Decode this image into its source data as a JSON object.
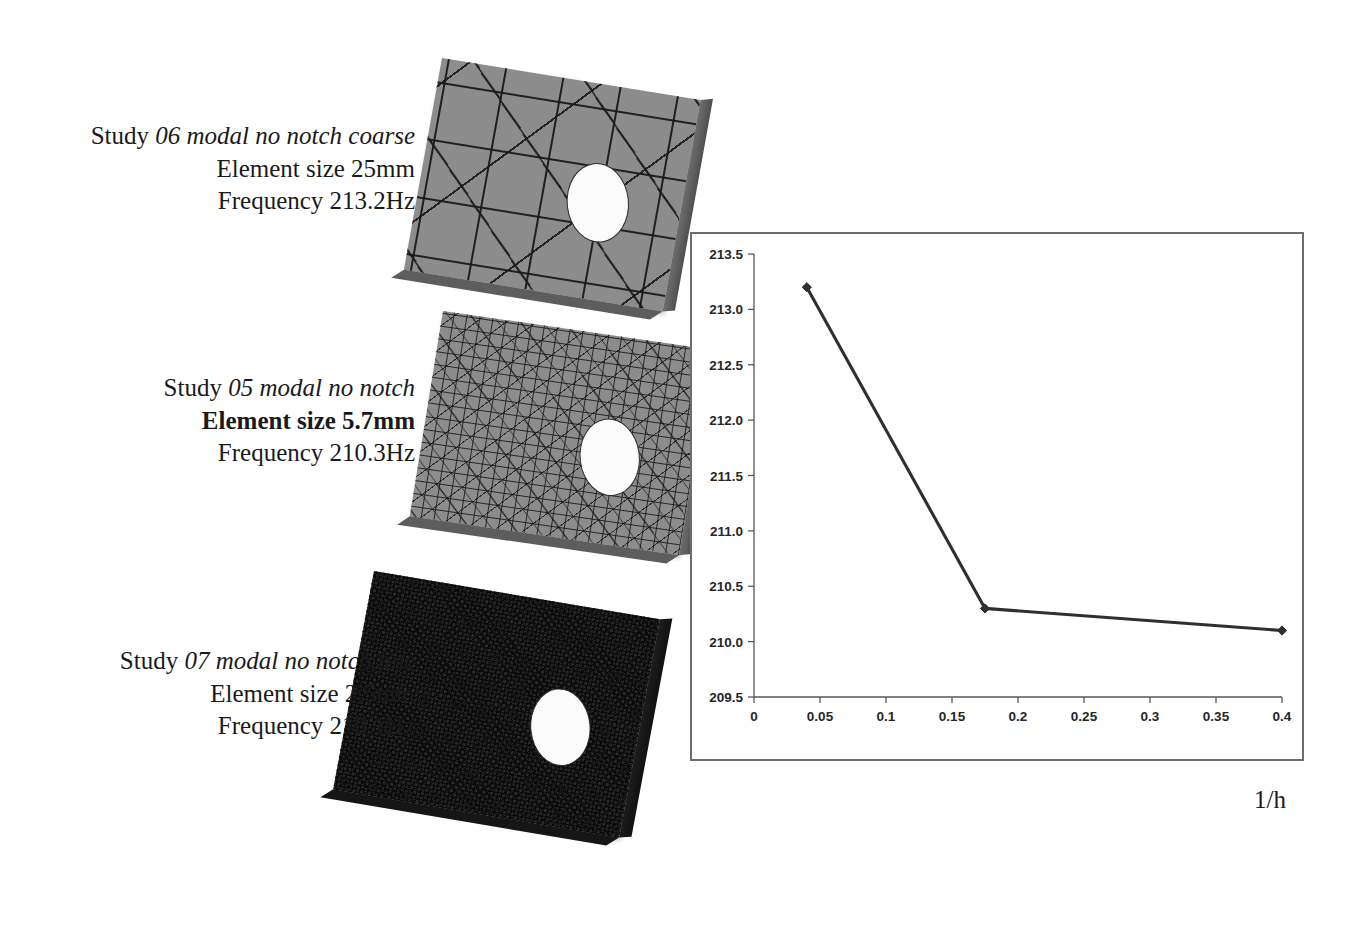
{
  "figure": {
    "studies": [
      {
        "id": "coarse",
        "title_prefix": "Study ",
        "title_name": "06 modal no notch coarse",
        "element_size": "Element size 25mm",
        "element_size_bold": false,
        "frequency": "Frequency 213.2Hz",
        "mesh_density": "coarse"
      },
      {
        "id": "medium",
        "title_prefix": "Study ",
        "title_name": "05 modal no notch",
        "element_size": "Element size 5.7mm",
        "element_size_bold": true,
        "frequency": "Frequency 210.3Hz",
        "mesh_density": "medium"
      },
      {
        "id": "fine",
        "title_prefix": "Study ",
        "title_name": "07 modal no notch fine",
        "element_size": "Element size 2.5mm",
        "element_size_bold": false,
        "frequency": "Frequency 210.1Hz",
        "mesh_density": "fine"
      }
    ]
  },
  "chart_data": {
    "type": "line",
    "title": "",
    "xlabel": "1/h",
    "ylabel": "",
    "x": [
      0.04,
      0.175,
      0.4
    ],
    "values": [
      213.2,
      210.3,
      210.1
    ],
    "series": [
      {
        "name": "Frequency",
        "x": [
          0.04,
          0.175,
          0.4
        ],
        "values": [
          213.2,
          210.3,
          210.1
        ]
      }
    ],
    "xlim": [
      0,
      0.4
    ],
    "ylim": [
      209.5,
      213.5
    ],
    "xticks": [
      "0",
      "0.05",
      "0.1",
      "0.15",
      "0.2",
      "0.25",
      "0.3",
      "0.35",
      "0.4"
    ],
    "xtick_values": [
      0,
      0.05,
      0.1,
      0.15,
      0.2,
      0.25,
      0.3,
      0.35,
      0.4
    ],
    "yticks": [
      "209.5",
      "210.0",
      "210.5",
      "211.0",
      "211.5",
      "212.0",
      "212.5",
      "213.0",
      "213.5"
    ],
    "ytick_values": [
      209.5,
      210.0,
      210.5,
      211.0,
      211.5,
      212.0,
      212.5,
      213.0,
      213.5
    ],
    "grid": false,
    "legend": "none",
    "line_color": "#2f2f2f",
    "marker": "diamond",
    "background": "#ffffff"
  },
  "colors": {
    "plate_fill": "#8c8c8c",
    "mesh_line": "#1a1a1a",
    "hole_fill": "#fbfbfb",
    "chart_border": "#6d6d6d",
    "axis": "#585858",
    "text": "#1a1a1a"
  }
}
